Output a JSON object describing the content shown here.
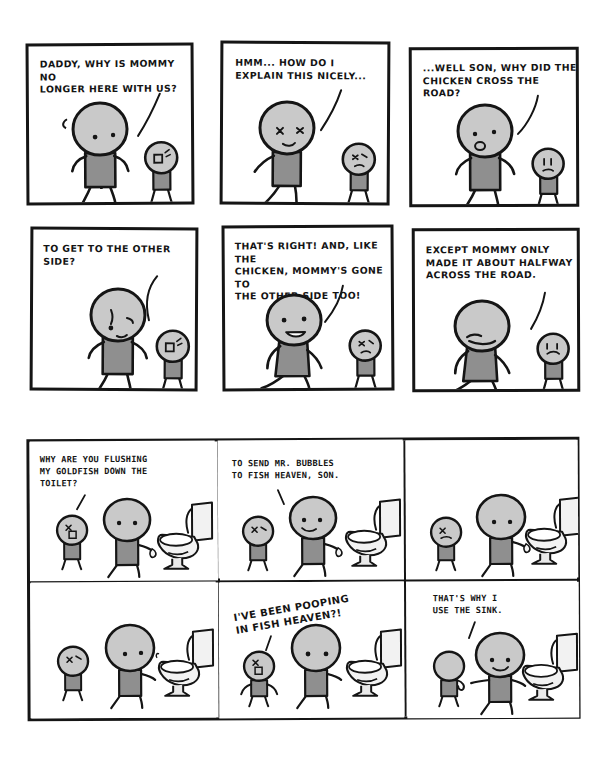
{
  "comic": {
    "title": "Explanations",
    "ink_color": "#151515",
    "paper_color": "#ffffff",
    "body_fill": "#9a9a9a",
    "head_fill": "#c9c9c9",
    "porcelain_fill": "#f2f2f2"
  },
  "strips": [
    {
      "id": "strip-1",
      "name": "chicken-crossed-the-road",
      "layout": "separate-panels",
      "panels": [
        {
          "index": 1,
          "dialogue": "DADDY, WHY IS MOMMY NO\nLONGER HERE WITH US?",
          "speaker": "child",
          "scene": "father-and-child"
        },
        {
          "index": 2,
          "dialogue": "HMM... HOW DO I\nEXPLAIN THIS NICELY...",
          "speaker": "father",
          "scene": "father-thinking"
        },
        {
          "index": 3,
          "dialogue": "...WELL SON, WHY DID THE\nCHICKEN CROSS THE ROAD?",
          "speaker": "father",
          "scene": "father-and-child"
        },
        {
          "index": 4,
          "dialogue": "TO GET TO THE OTHER SIDE?",
          "speaker": "child",
          "scene": "father-and-child"
        },
        {
          "index": 5,
          "dialogue": "THAT'S RIGHT! AND, LIKE THE\nCHICKEN, MOMMY'S GONE TO\nTHE OTHER SIDE TOO!",
          "speaker": "father",
          "scene": "father-smiling"
        },
        {
          "index": 6,
          "dialogue": "EXCEPT MOMMY ONLY\nMADE IT ABOUT HALFWAY\nACROSS THE ROAD.",
          "speaker": "father",
          "scene": "father-grimacing"
        }
      ]
    },
    {
      "id": "strip-2",
      "name": "fish-heaven",
      "layout": "shared-border-grid",
      "panels": [
        {
          "index": 1,
          "dialogue": "WHY ARE YOU FLUSHING\nMY GOLDFISH DOWN THE\nTOILET?",
          "speaker": "child",
          "scene": "child-father-toilet"
        },
        {
          "index": 2,
          "dialogue": "TO SEND MR. BUBBLES\nTO FISH HEAVEN, SON.",
          "speaker": "father",
          "scene": "child-father-toilet"
        },
        {
          "index": 3,
          "dialogue": "",
          "speaker": "none",
          "scene": "child-father-toilet-silent"
        },
        {
          "index": 4,
          "dialogue": "",
          "speaker": "none",
          "scene": "child-father-toilet-silent"
        },
        {
          "index": 5,
          "dialogue": "I'VE BEEN POOPING\nIN FISH HEAVEN?!",
          "speaker": "father",
          "scene": "child-father-toilet-shock",
          "style": "tilted"
        },
        {
          "index": 6,
          "dialogue": "THAT'S WHY I\nUSE THE SINK.",
          "speaker": "father",
          "scene": "child-father-toilet"
        }
      ]
    }
  ]
}
